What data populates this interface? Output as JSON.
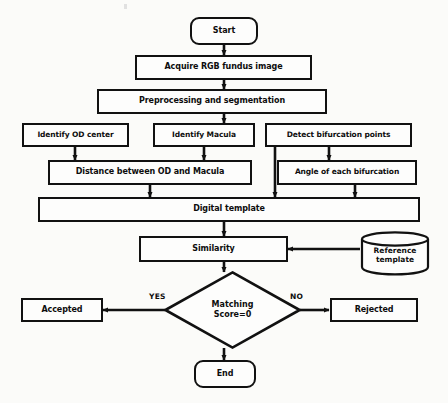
{
  "diagram": {
    "line_color": "#111111",
    "text_color": "#0d0d0d",
    "background_color": "#fbfbf9"
  },
  "nodes": {
    "start": {
      "label": "Start",
      "shape": "terminator"
    },
    "acquire": {
      "label": "Acquire RGB fundus image",
      "shape": "process"
    },
    "preprocess": {
      "label": "Preprocessing and segmentation",
      "shape": "process"
    },
    "identify_od": {
      "label": "Identify OD center",
      "shape": "process"
    },
    "identify_macula": {
      "label": "Identify Macula",
      "shape": "process"
    },
    "detect_bifurcation": {
      "label": "Detect bifurcation points",
      "shape": "process"
    },
    "distance": {
      "label": "Distance between OD and Macula",
      "shape": "process"
    },
    "angle": {
      "label": "Angle of each bifurcation",
      "shape": "process"
    },
    "digital_template": {
      "label": "Digital template",
      "shape": "process"
    },
    "similarity": {
      "label": "Similarity",
      "shape": "process"
    },
    "reference_template": {
      "label": "Reference\ntemplate",
      "shape": "database"
    },
    "decision": {
      "label": "Matching\nScore=0",
      "shape": "decision"
    },
    "accepted": {
      "label": "Accepted",
      "shape": "process"
    },
    "rejected": {
      "label": "Rejected",
      "shape": "process"
    },
    "end": {
      "label": "End",
      "shape": "terminator"
    }
  },
  "edge_labels": {
    "yes": "YES",
    "no": "NO"
  }
}
